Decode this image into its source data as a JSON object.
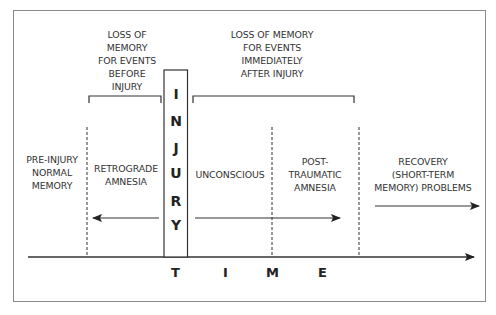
{
  "diagram": {
    "top_labels": {
      "before": [
        "LOSS OF",
        "MEMORY",
        "FOR EVENTS",
        "BEFORE",
        "INJURY"
      ],
      "after": [
        "LOSS OF MEMORY",
        "FOR EVENTS",
        "IMMEDIATELY",
        "AFTER INJURY"
      ]
    },
    "injury_letters": [
      "I",
      "N",
      "J",
      "U",
      "R",
      "Y"
    ],
    "phases": {
      "pre_injury": [
        "PRE-INJURY",
        "NORMAL",
        "MEMORY"
      ],
      "retrograde": [
        "RETROGRADE",
        "AMNESIA"
      ],
      "unconscious": [
        "UNCONSCIOUS"
      ],
      "post_traumatic": [
        "POST-",
        "TRAUMATIC",
        "AMNESIA"
      ],
      "recovery": [
        "RECOVERY",
        "(SHORT-TERM",
        "MEMORY) PROBLEMS"
      ]
    },
    "axis_label_letters": [
      "T",
      "I",
      "M",
      "E"
    ],
    "colors": {
      "line": "#222222",
      "frame": "#8a8a8a",
      "background": "#ffffff"
    }
  }
}
